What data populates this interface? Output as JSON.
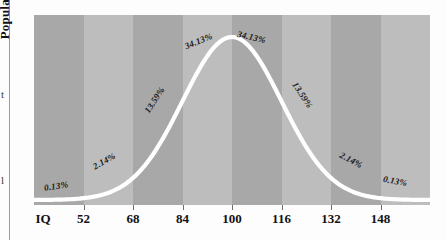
{
  "page": {
    "background_color": "#fdfdfd",
    "column_rule_color": "#9a9a9a",
    "cropped_fragments": [
      {
        "text": "t"
      },
      {
        "text": "l"
      }
    ]
  },
  "chart_data": {
    "type": "line",
    "title": "",
    "xlabel": "IQ",
    "ylabel": "Population",
    "curve": "normal-distribution-bell-curve",
    "curve_color": "#ffffff",
    "mean": 100,
    "std_dev": 16,
    "xlim": [
      36,
      164
    ],
    "ylim": [
      0,
      1
    ],
    "grid": false,
    "legend": false,
    "band_colors": [
      "#a8a8a8",
      "#bdbdbd"
    ],
    "categories": [
      "36-52",
      "52-68",
      "68-84",
      "84-100",
      "100-116",
      "116-132",
      "132-148",
      "148-164"
    ],
    "values": [
      0.13,
      2.14,
      13.59,
      34.13,
      34.13,
      13.59,
      2.14,
      0.13
    ],
    "x_ticks": [
      {
        "label": "IQ",
        "value": 36
      },
      {
        "label": "52",
        "value": 52
      },
      {
        "label": "68",
        "value": 68
      },
      {
        "label": "84",
        "value": 84
      },
      {
        "label": "100",
        "value": 100
      },
      {
        "label": "116",
        "value": 116
      },
      {
        "label": "132",
        "value": 132
      },
      {
        "label": "148",
        "value": 148
      }
    ],
    "annotations": [
      {
        "text": "0.13%",
        "x": 44,
        "y": 181,
        "rotation": -8
      },
      {
        "text": "2.14%",
        "x": 92,
        "y": 156,
        "rotation": -30
      },
      {
        "text": "13.59%",
        "x": 140,
        "y": 95,
        "rotation": -57
      },
      {
        "text": "34.13%",
        "x": 184,
        "y": 36,
        "rotation": -22
      },
      {
        "text": "34.13%",
        "x": 237,
        "y": 32,
        "rotation": 13
      },
      {
        "text": "13.59%",
        "x": 288,
        "y": 90,
        "rotation": 57
      },
      {
        "text": "2.14%",
        "x": 339,
        "y": 155,
        "rotation": 28
      },
      {
        "text": "0.13%",
        "x": 383,
        "y": 176,
        "rotation": 10
      }
    ]
  }
}
